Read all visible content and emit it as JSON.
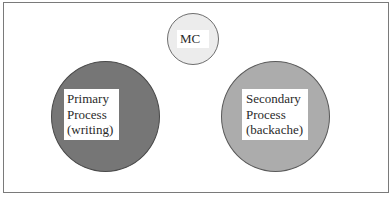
{
  "diagram": {
    "nodes": [
      {
        "id": "mc",
        "lines": [
          "MC"
        ],
        "fill": "#ececec",
        "size": "small"
      },
      {
        "id": "primary",
        "lines": [
          "Primary",
          "Process",
          "(writing)"
        ],
        "fill": "#767676",
        "size": "large"
      },
      {
        "id": "secondary",
        "lines": [
          "Secondary",
          "Process",
          "(backache)"
        ],
        "fill": "#acacac",
        "size": "large"
      }
    ],
    "edges": []
  }
}
